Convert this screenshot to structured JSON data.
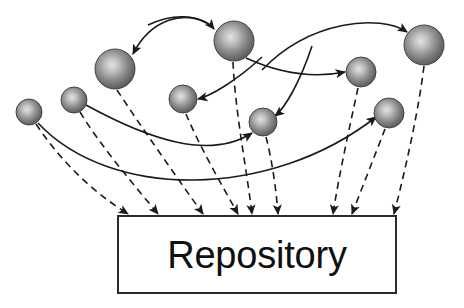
{
  "diagram": {
    "canvas": {
      "width": 464,
      "height": 308,
      "background": "#ffffff"
    },
    "repository": {
      "label": "Repository",
      "x": 118,
      "y": 216,
      "width": 278,
      "height": 77,
      "fill": "#ffffff",
      "stroke": "#2b2b2b",
      "stroke_width": 2,
      "label_color": "#101010",
      "label_font_size": 38
    },
    "sphere_style": {
      "base_color": "#6e6e6e",
      "highlight_color": "#d8d8d8",
      "edge_color": "#4a4a4a",
      "outline_color": "#3a3a3a"
    },
    "line_style": {
      "solid_color": "#1a1a1a",
      "dashed_color": "#1a1a1a",
      "solid_width": 1.6,
      "dashed_width": 1.6,
      "dash_pattern": "7,5"
    },
    "spheres": [
      {
        "id": "component-1",
        "name": "component-sphere-1",
        "cx": 29,
        "cy": 112,
        "r": 13,
        "size": "small"
      },
      {
        "id": "component-2",
        "name": "component-sphere-2",
        "cx": 74,
        "cy": 100,
        "r": 13,
        "size": "small"
      },
      {
        "id": "component-3",
        "name": "component-sphere-3",
        "cx": 115,
        "cy": 69,
        "r": 20,
        "size": "large"
      },
      {
        "id": "component-4",
        "name": "component-sphere-4",
        "cx": 183,
        "cy": 99,
        "r": 14,
        "size": "medium"
      },
      {
        "id": "component-5",
        "name": "component-sphere-5",
        "cx": 234,
        "cy": 41,
        "r": 20,
        "size": "large"
      },
      {
        "id": "component-6",
        "name": "component-sphere-6",
        "cx": 263,
        "cy": 122,
        "r": 14,
        "size": "medium"
      },
      {
        "id": "component-7",
        "name": "component-sphere-7",
        "cx": 361,
        "cy": 72,
        "r": 15,
        "size": "medium"
      },
      {
        "id": "component-8",
        "name": "component-sphere-8",
        "cx": 389,
        "cy": 113,
        "r": 15,
        "size": "medium"
      },
      {
        "id": "component-9",
        "name": "component-sphere-9",
        "cx": 424,
        "cy": 45,
        "r": 20,
        "size": "large"
      }
    ],
    "repository_arrows": [
      {
        "id": "repo-arrow-1",
        "from": "component-1",
        "path": "M 36 124 C 60 160 90 190 128 214"
      },
      {
        "id": "repo-arrow-2",
        "from": "component-2",
        "path": "M 80 112 C 100 145 130 180 158 214"
      },
      {
        "id": "repo-arrow-3",
        "from": "component-3",
        "path": "M 117 90 C 140 125 175 175 203 214"
      },
      {
        "id": "repo-arrow-4",
        "from": "component-4",
        "path": "M 186 114 C 199 145 220 182 238 214"
      },
      {
        "id": "repo-arrow-5",
        "from": "component-5",
        "path": "M 233 62 C 235 110 246 165 252 214"
      },
      {
        "id": "repo-arrow-6",
        "from": "component-6",
        "path": "M 266 137 C 272 160 276 188 278 214"
      },
      {
        "id": "repo-arrow-7",
        "from": "component-7",
        "path": "M 358 88 C 350 125 339 175 333 214"
      },
      {
        "id": "repo-arrow-8",
        "from": "component-8",
        "path": "M 385 129 C 375 155 362 188 352 214"
      },
      {
        "id": "repo-arrow-9",
        "from": "component-9",
        "path": "M 424 66 C 418 115 404 175 394 214"
      }
    ],
    "peer_arrows": [
      {
        "id": "peer-arrow-1",
        "from": "component-5",
        "to": "component-3",
        "path": "M 213 27 C 185 7 150 20 133 54"
      },
      {
        "id": "peer-arrow-2",
        "from": "component-3",
        "to": "component-5",
        "path": "M 148 25 C 180 10 205 18 214 29"
      },
      {
        "id": "peer-arrow-3",
        "from": "component-5",
        "to": "component-4",
        "path": "M 262 57 C 235 82 210 96 198 99"
      },
      {
        "id": "peer-arrow-4",
        "from": "component-6",
        "to": "component-9",
        "path": "M 262 70 C 310 20 380 14 407 32"
      },
      {
        "id": "peer-arrow-5",
        "from": "component-4",
        "to": "component-7",
        "path": "M 246 58 C 290 78 325 76 345 72"
      },
      {
        "id": "peer-arrow-6",
        "from": "component-7",
        "to": "component-6",
        "path": "M 312 46 C 300 82 285 108 275 116"
      },
      {
        "id": "peer-arrow-7",
        "from": "component-2",
        "to": "component-6",
        "path": "M 86 105 C 150 140 210 160 252 133"
      },
      {
        "id": "peer-arrow-8",
        "from": "component-1",
        "to": "component-8",
        "path": "M 38 123 C 110 200 270 200 376 117"
      }
    ],
    "arrowhead": {
      "name": "solid-arrowhead",
      "length": 9,
      "width": 7
    }
  }
}
